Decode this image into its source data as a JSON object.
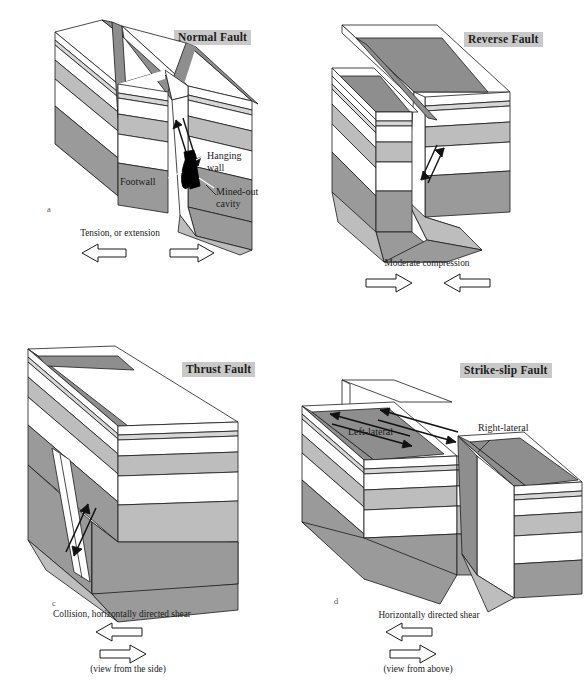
{
  "figure": {
    "kind": "fault-types-block-diagram",
    "panel_count": 4
  },
  "colors": {
    "white_layer": "#ffffff",
    "light_gray_layer": "#d6d6d6",
    "medium_gray_layer": "#bdbdbd",
    "dark_gray_layer": "#9a9a9a",
    "fault_plane": "#8e8e8e",
    "title_highlight": "#c9c9c9",
    "stroke": "#1a1a1a",
    "cavity_fill": "#000000"
  },
  "panels": [
    {
      "key": "a",
      "letter": "a",
      "title": "Normal Fault",
      "annotations": [
        {
          "name": "hanging-wall",
          "text": "Hanging\nwall"
        },
        {
          "name": "footwall",
          "text": "Footwall"
        },
        {
          "name": "mined-out-cavity",
          "text": "Mined-out\ncavity"
        }
      ],
      "caption": "Tension, or extension",
      "subcaption": "",
      "arrows": {
        "left": "left",
        "right": "right",
        "layout": "side-by-side"
      }
    },
    {
      "key": "b",
      "letter": "b",
      "title": "Reverse Fault",
      "annotations": [],
      "caption": "Moderate compression",
      "subcaption": "",
      "arrows": {
        "left": "right",
        "right": "left",
        "layout": "side-by-side"
      }
    },
    {
      "key": "c",
      "letter": "c",
      "title": "Thrust Fault",
      "annotations": [],
      "caption": "Collision, horizontally directed shear",
      "subcaption": "(view from the side)",
      "arrows": {
        "top": "left",
        "bottom": "right",
        "layout": "stacked"
      }
    },
    {
      "key": "d",
      "letter": "d",
      "title": "Strike-slip Fault",
      "annotations": [
        {
          "name": "left-lateral",
          "text": "Left-lateral"
        },
        {
          "name": "right-lateral",
          "text": "Right-lateral"
        }
      ],
      "caption": "Horizontally directed shear",
      "subcaption": "(view from above)",
      "arrows": {
        "top": "left",
        "bottom": "right",
        "layout": "stacked"
      }
    }
  ],
  "strata": {
    "note": "sequence top to bottom on block front face",
    "sequence": [
      "white",
      "light-gray (thin)",
      "white",
      "medium-gray",
      "white",
      "dark-gray"
    ]
  }
}
